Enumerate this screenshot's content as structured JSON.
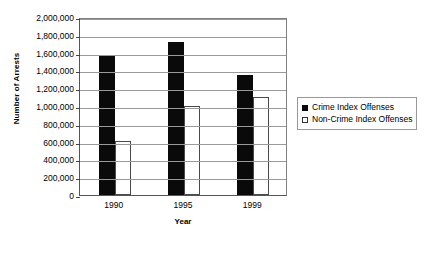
{
  "chart_data": {
    "type": "bar",
    "title": "",
    "xlabel": "Year",
    "ylabel": "Number of Arrests",
    "categories": [
      "1990",
      "1995",
      "1999"
    ],
    "ylim": [
      0,
      2000000
    ],
    "ytick_step": 200000,
    "yticks": [
      "0",
      "200,000",
      "400,000",
      "600,000",
      "800,000",
      "1,000,000",
      "1,200,000",
      "1,400,000",
      "1,600,000",
      "1,800,000",
      "2,000,000"
    ],
    "ytick_values": [
      0,
      200000,
      400000,
      600000,
      800000,
      1000000,
      1200000,
      1400000,
      1600000,
      1800000,
      2000000
    ],
    "grid": true,
    "legend_position": "right",
    "series": [
      {
        "name": "Crime Index Offenses",
        "color": "#0a0a0a",
        "fill": "solid",
        "values": [
          1575000,
          1720000,
          1350000
        ]
      },
      {
        "name": "Non-Crime Index Offenses",
        "color": "#ffffff",
        "fill": "outline",
        "values": [
          610000,
          1000000,
          1105000
        ]
      }
    ]
  },
  "caption": {
    "clipped_text": ""
  }
}
